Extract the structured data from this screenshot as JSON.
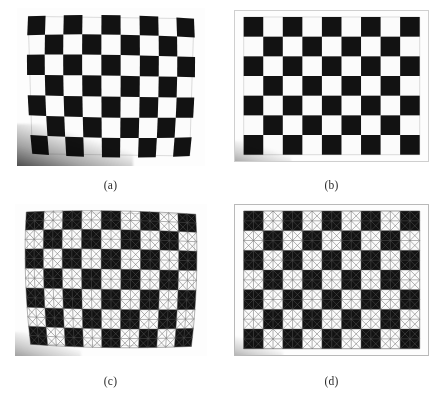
{
  "figure": {
    "background_color": "#ffffff",
    "caption_color": "#2a2a2a",
    "layout": {
      "columns": 2,
      "rows": 2
    }
  },
  "board": {
    "cols": 9,
    "rows": 7,
    "square_dark_color": "#121212",
    "square_light_color": "#fdfdfd",
    "border_color": "#cfcfcf"
  },
  "mesh": {
    "line_color": "#5a5a5a",
    "line_width": 0.55,
    "subdivisions_per_square": 2,
    "diagonals": "both",
    "description": "triangular mesh overlay"
  },
  "panels": [
    {
      "id": "a",
      "caption": "(a)",
      "kind": "distorted-photo",
      "mesh_overlay": false,
      "has_corner_shadow": true,
      "distortion": {
        "type": "barrel-perspective",
        "k": 0.085,
        "shear": 0.03
      }
    },
    {
      "id": "b",
      "caption": "(b)",
      "kind": "rectified-photo",
      "mesh_overlay": false,
      "has_corner_shadow": true,
      "distortion": {
        "type": "none",
        "k": 0.0,
        "shear": 0.0
      }
    },
    {
      "id": "c",
      "caption": "(c)",
      "kind": "distorted-photo-with-mesh",
      "mesh_overlay": true,
      "has_corner_shadow": true,
      "distortion": {
        "type": "barrel-perspective",
        "k": 0.085,
        "shear": 0.03
      }
    },
    {
      "id": "d",
      "caption": "(d)",
      "kind": "rectified-photo-with-mesh",
      "mesh_overlay": true,
      "has_corner_shadow": true,
      "distortion": {
        "type": "none",
        "k": 0.0,
        "shear": 0.0
      }
    }
  ]
}
